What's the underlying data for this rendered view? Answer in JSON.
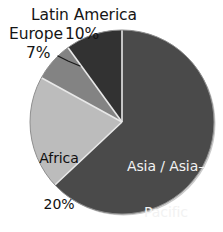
{
  "chart_data": {
    "type": "pie",
    "title": "",
    "subtitle": "",
    "xlabel": "",
    "ylabel": "",
    "legend_position": "none",
    "grid": false,
    "units": "percent",
    "total": 100,
    "categories": [
      "Asia / Asia-Pacific",
      "Africa",
      "Europe",
      "Latin America"
    ],
    "values": [
      63,
      20,
      7,
      10
    ],
    "start_angle_deg": 0,
    "direction": "clockwise",
    "slices": [
      {
        "name": "Asia / Asia-Pacific",
        "label_line1": "Asia / Asia–",
        "label_line2": "Pacific",
        "value": 63,
        "value_label": "63%",
        "color": "#4a4a4a",
        "label_placement": "inside"
      },
      {
        "name": "Africa",
        "label_line1": "Africa",
        "label_line2": "",
        "value": 20,
        "value_label": "20%",
        "color": "#bcbcbc",
        "label_placement": "inside"
      },
      {
        "name": "Europe",
        "label_line1": "Europe",
        "label_line2": "",
        "value": 7,
        "value_label": "7%",
        "color": "#838383",
        "label_placement": "outside",
        "has_leader_line": true
      },
      {
        "name": "Latin America",
        "label_line1": "Latin America",
        "label_line2": "",
        "value": 10,
        "value_label": "10%",
        "color": "#323232",
        "label_placement": "outside"
      }
    ],
    "separator_color": "#e8e8e8",
    "background_color": "#ffffff",
    "outline_color": "#9a9a9a"
  },
  "labels": {
    "latin_america_name": "Latin America",
    "latin_america_pct": "10%",
    "europe_name": "Europe",
    "europe_pct": "7%",
    "africa_name": "Africa",
    "africa_pct": "20%",
    "asia_name_line1": "Asia / Asia–",
    "asia_name_line2": "Pacific",
    "asia_pct": "63%"
  }
}
